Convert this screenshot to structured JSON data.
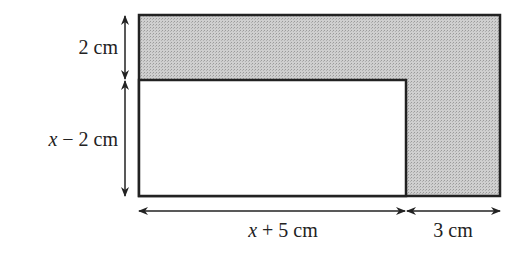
{
  "diagram": {
    "type": "composite-rectangle",
    "shaded_color": "#c8c8c8",
    "outline_color": "#222222",
    "labels": {
      "top_height": "2 cm",
      "inner_height_var": "x",
      "inner_height_rest": " − 2 cm",
      "inner_width_var": "x",
      "inner_width_rest": " + 5 cm",
      "right_width": "3 cm"
    }
  }
}
